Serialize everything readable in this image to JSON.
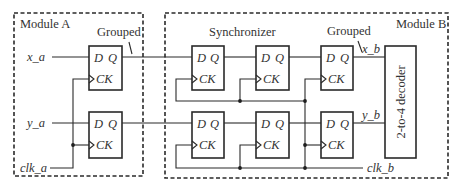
{
  "modules": {
    "a": {
      "title": "Module A"
    },
    "b": {
      "title": "Module B"
    }
  },
  "annotations": {
    "grouped_a": "Grouped",
    "grouped_b": "Grouped",
    "synchronizer": "Synchronizer"
  },
  "signals": {
    "x_a": "x_a",
    "y_a": "y_a",
    "clk_a": "clk_a",
    "x_b": "x_b",
    "y_b": "y_b",
    "clk_b": "clk_b"
  },
  "flipflop": {
    "d_pin": "D",
    "q_pin": "Q",
    "ck_pin": "CK"
  },
  "decoder": {
    "label": "2-to-4 decoder"
  },
  "colors": {
    "line": "#2a2a2a",
    "text": "#333333",
    "background": "#ffffff"
  }
}
